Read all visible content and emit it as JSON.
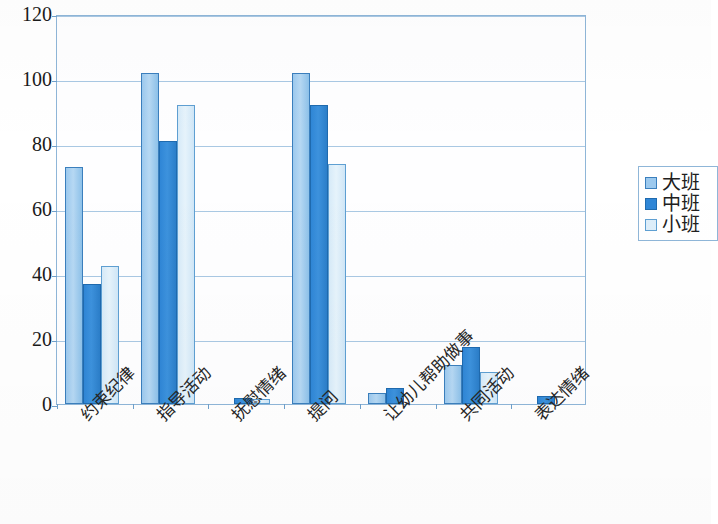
{
  "chart_data": {
    "type": "bar",
    "title": "",
    "subtitle": "",
    "xlabel": "",
    "ylabel": "",
    "ylim": [
      0,
      120
    ],
    "yticks": [
      0,
      20,
      40,
      60,
      80,
      100,
      120
    ],
    "grid": true,
    "legend_position": "right",
    "categories": [
      "约束纪律",
      "指导活动",
      "抚慰情绪",
      "提问",
      "让幼儿帮助做事",
      "共同活动",
      "表达情绪"
    ],
    "series": [
      {
        "name": "大班",
        "color": "#9cc9ee",
        "values": [
          73,
          102,
          0,
          102,
          3.5,
          12,
          0
        ]
      },
      {
        "name": "中班",
        "color": "#2f86d6",
        "values": [
          37,
          81,
          2,
          92,
          5,
          17.5,
          2.5
        ]
      },
      {
        "name": "小班",
        "color": "#ddeefa",
        "values": [
          42.5,
          92,
          1.5,
          74,
          0,
          10,
          0
        ]
      }
    ]
  },
  "legend": {
    "items": [
      {
        "label": "大班",
        "swatch": "legend-swatch-daban"
      },
      {
        "label": "中班",
        "swatch": "legend-swatch-zhongban"
      },
      {
        "label": "小班",
        "swatch": "legend-swatch-xiaoban"
      }
    ]
  },
  "axis": {
    "y_tick_labels": [
      "120",
      "100",
      "80",
      "60",
      "40",
      "20",
      "0"
    ]
  }
}
